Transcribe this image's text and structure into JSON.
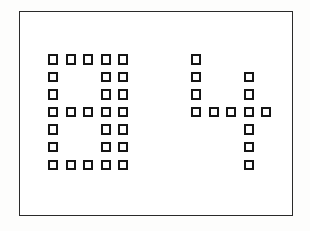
{
  "panel": {
    "name": "dot-matrix-glyph-panel",
    "background_color": "#fdfdfc",
    "frame_color": "#2a2a2a",
    "frame_style": "thin rectangular outline",
    "canvas_color": "#ffffff"
  },
  "module": {
    "square_fill_color": "#ffffff",
    "square_stroke_color": "#151515",
    "square_style": "hollow-outlined-square",
    "grid_columns": 5,
    "grid_rows": 7,
    "cell_pitch_px": 17.6,
    "square_size_px": 10
  },
  "glyphs": [
    {
      "id": "glyph-left",
      "reading": "G",
      "position": "left",
      "lit_count": 25,
      "matrix": [
        [
          1,
          1,
          1,
          1,
          1
        ],
        [
          1,
          0,
          0,
          1,
          1
        ],
        [
          1,
          0,
          0,
          1,
          1
        ],
        [
          1,
          1,
          1,
          1,
          1
        ],
        [
          1,
          0,
          0,
          1,
          1
        ],
        [
          1,
          0,
          0,
          1,
          1
        ],
        [
          1,
          1,
          1,
          1,
          1
        ]
      ]
    },
    {
      "id": "glyph-right",
      "reading": "4",
      "position": "right",
      "lit_count": 14,
      "matrix": [
        [
          1,
          0,
          0,
          0,
          0
        ],
        [
          1,
          0,
          0,
          1,
          0
        ],
        [
          1,
          0,
          0,
          1,
          0
        ],
        [
          1,
          1,
          1,
          1,
          1
        ],
        [
          0,
          0,
          0,
          1,
          0
        ],
        [
          0,
          0,
          0,
          1,
          0
        ],
        [
          0,
          0,
          0,
          1,
          0
        ]
      ]
    }
  ]
}
